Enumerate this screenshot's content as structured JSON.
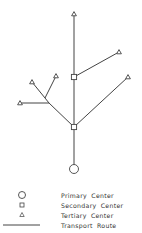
{
  "diagram": {
    "type": "hierarchical transport network",
    "stroke_color": "#444444",
    "nodes": [
      {
        "id": "P1",
        "type": "primary",
        "x": 74,
        "y": 169
      },
      {
        "id": "S1",
        "type": "secondary",
        "x": 74,
        "y": 127
      },
      {
        "id": "S2",
        "type": "secondary",
        "x": 74,
        "y": 77
      },
      {
        "id": "T1",
        "type": "tertiary",
        "x": 74,
        "y": 14
      },
      {
        "id": "T2",
        "type": "tertiary",
        "x": 119,
        "y": 52
      },
      {
        "id": "T3",
        "type": "tertiary",
        "x": 128,
        "y": 77
      },
      {
        "id": "T4",
        "type": "tertiary",
        "x": 56,
        "y": 76
      },
      {
        "id": "T5",
        "type": "tertiary",
        "x": 32,
        "y": 82
      },
      {
        "id": "T6",
        "type": "tertiary",
        "x": 20,
        "y": 103
      }
    ],
    "junctions": [
      {
        "id": "J1",
        "x": 45,
        "y": 98
      },
      {
        "id": "J2",
        "x": 49,
        "y": 103
      }
    ],
    "routes": [
      [
        "P1",
        "S1"
      ],
      [
        "S1",
        "S2"
      ],
      [
        "S2",
        "T1"
      ],
      [
        "S2",
        "T2"
      ],
      [
        "S1",
        "T3"
      ],
      [
        "S1",
        "J2"
      ],
      [
        "J2",
        "J1"
      ],
      [
        "J1",
        "T5"
      ],
      [
        "J1",
        "T4"
      ],
      [
        "J2",
        "T6"
      ]
    ]
  },
  "legend": {
    "items": [
      {
        "symbol": "circle",
        "label": "Primary  Center"
      },
      {
        "symbol": "square",
        "label": "Secondary  Center"
      },
      {
        "symbol": "triangle",
        "label": "Tertiary  Center"
      },
      {
        "symbol": "line",
        "label": "Transport  Route"
      }
    ]
  }
}
